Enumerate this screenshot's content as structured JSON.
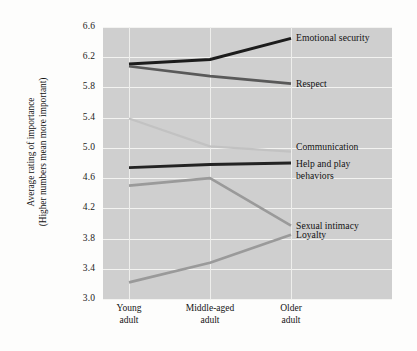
{
  "chart_data": {
    "type": "line",
    "title": "",
    "xlabel": "",
    "ylabel": "Average rating of importance\n(Higher numbers mean more important)",
    "ylabel_line1": "Average rating of importance",
    "ylabel_line2": "(Higher numbers mean more important)",
    "categories": [
      "Young adult",
      "Middle-aged adult",
      "Older adult"
    ],
    "category_lines": [
      [
        "Young",
        "adult"
      ],
      [
        "Middle-aged",
        "adult"
      ],
      [
        "Older",
        "adult"
      ]
    ],
    "ylim": [
      3.0,
      6.6
    ],
    "ytick_values": [
      3.0,
      3.4,
      3.8,
      4.2,
      4.6,
      5.0,
      5.4,
      5.8,
      6.2,
      6.6
    ],
    "ytick_labels": [
      "3.0",
      "3.4",
      "3.8",
      "4.2",
      "4.6",
      "5.0",
      "5.4",
      "5.8",
      "6.2",
      "6.6"
    ],
    "grid": true,
    "grid_color": "#f3f3f1",
    "panel_background": "#cfcfcf",
    "legend": "series end labels (right of plot)",
    "series": [
      {
        "name": "Emotional security",
        "label_lines": [
          "Emotional security"
        ],
        "values": [
          6.11,
          6.17,
          6.45
        ],
        "color": "#1c1c1c",
        "width": 3.0
      },
      {
        "name": "Respect",
        "label_lines": [
          "Respect"
        ],
        "values": [
          6.08,
          5.95,
          5.85
        ],
        "color": "#595959",
        "width": 2.6
      },
      {
        "name": "Communication",
        "label_lines": [
          "Communication"
        ],
        "values": [
          5.39,
          5.02,
          4.95
        ],
        "color": "#c2c2c2",
        "width": 2.2
      },
      {
        "name": "Help and play behaviors",
        "label_lines": [
          "Help and play",
          "behaviors"
        ],
        "values": [
          4.74,
          4.78,
          4.8
        ],
        "color": "#232323",
        "width": 2.8
      },
      {
        "name": "Sexual intimacy",
        "label_lines": [
          "Sexual intimacy"
        ],
        "values": [
          4.5,
          4.6,
          3.97
        ],
        "color": "#9a9a9a",
        "width": 2.6
      },
      {
        "name": "Loyalty",
        "label_lines": [
          "Loyalty"
        ],
        "values": [
          3.22,
          3.48,
          3.85
        ],
        "color": "#9a9a9a",
        "width": 2.6
      }
    ]
  }
}
